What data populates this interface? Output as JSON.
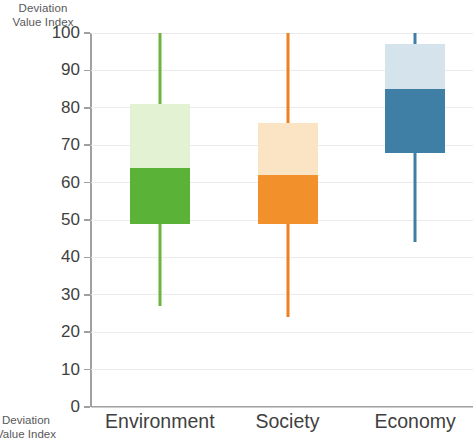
{
  "chart_data": {
    "type": "box",
    "title": "",
    "xlabel": "",
    "ylabel": "Deviation Value Index",
    "ylim": [
      0,
      100
    ],
    "grid": true,
    "legend": "none",
    "categories": [
      "Environment",
      "Society",
      "Economy"
    ],
    "yticks": [
      100,
      90,
      80,
      70,
      60,
      50,
      40,
      30,
      20,
      10,
      0
    ],
    "ytick_labels": [
      "100",
      "90",
      "80",
      "70",
      "60",
      "50",
      "40",
      "30",
      "20",
      "10",
      "0"
    ],
    "series": [
      {
        "name": "Environment",
        "whisker_low": 27,
        "q1": 49,
        "median": 64,
        "q3": 81,
        "whisker_high": 100,
        "color_dark": "#5ab236",
        "color_light": "#e2f2d2",
        "color_line": "#6cb33f"
      },
      {
        "name": "Society",
        "whisker_low": 24,
        "q1": 49,
        "median": 62,
        "q3": 76,
        "whisker_high": 100,
        "color_dark": "#f2912c",
        "color_light": "#fbe4c4",
        "color_line": "#ef8022"
      },
      {
        "name": "Economy",
        "whisker_low": 44,
        "q1": 68,
        "median": 85,
        "q3": 97,
        "whisker_high": 100,
        "color_dark": "#3f7fa6",
        "color_light": "#d4e3ec",
        "color_line": "#3f7fa6"
      }
    ]
  },
  "axis": {
    "y_title_line1": "Deviation",
    "y_title_line2": "Value Index",
    "axis_color": "#9fa0a2",
    "grid_color": "#eceaea"
  },
  "footer_artifact": {
    "line1": "Deviation",
    "line2": "Value Index"
  }
}
